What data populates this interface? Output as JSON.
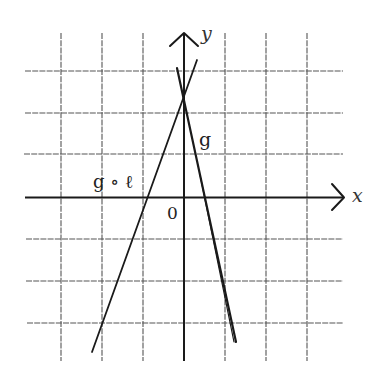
{
  "figure": {
    "type": "coordinate-plane-diagram",
    "axes": {
      "x_label": "x",
      "y_label": "y",
      "origin_label": "0"
    },
    "grid": {
      "x_lines_px": [
        61,
        102,
        143,
        184,
        225,
        266,
        307
      ],
      "y_lines_px": [
        71,
        113,
        154,
        197,
        239,
        281,
        323
      ],
      "unit_px": 41,
      "origin_px": [
        184,
        197
      ]
    },
    "lines": [
      {
        "name": "g",
        "label": "g",
        "description": "steep decreasing line",
        "from_px": [
          177,
          68
        ],
        "to_px": [
          236,
          342
        ],
        "label_px": [
          205,
          146
        ]
      },
      {
        "name": "g-compose-l",
        "label": "g ∘ ℓ",
        "description": "increasing line",
        "from_px": [
          92,
          352
        ],
        "to_px": [
          197,
          60
        ],
        "label_px": [
          96,
          188
        ]
      }
    ],
    "colors": {
      "background": "#ffffff",
      "ink": "#1a1a1a",
      "grid": "#555555"
    }
  }
}
